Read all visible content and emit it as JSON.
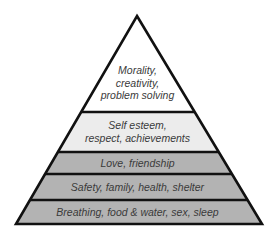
{
  "diagram": {
    "type": "pyramid",
    "colors": {
      "outline": "#111111",
      "level_top": "#ffffff",
      "level_esteem": "#ececec",
      "level_lower": "#b3b3b3",
      "text": "#3a3a3a"
    },
    "levels": [
      {
        "label_lines": [
          "Morality,",
          "creativity,",
          "problem solving"
        ]
      },
      {
        "label_lines": [
          "Self esteem,",
          "respect, achievements"
        ]
      },
      {
        "label_lines": [
          "Love, friendship"
        ]
      },
      {
        "label_lines": [
          "Safety, family, health, shelter"
        ]
      },
      {
        "label_lines": [
          "Breathing, food & water, sex, sleep"
        ]
      }
    ]
  }
}
